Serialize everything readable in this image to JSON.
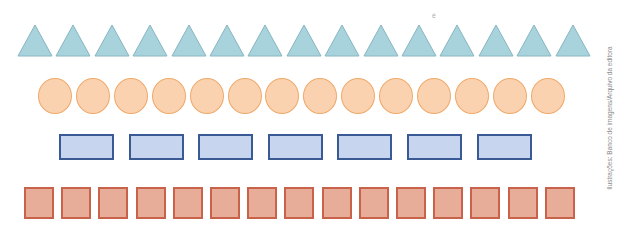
{
  "figure": {
    "rows": [
      {
        "shape": "triangle",
        "count": 15,
        "fill": "#a9d3dc",
        "stroke": "#86b6c1",
        "x0": 17,
        "step": 38.4,
        "top": 24
      },
      {
        "shape": "circle",
        "count": 14,
        "fill": "#fbd2b0",
        "stroke": "#efa96a",
        "x0": 38,
        "step": 37.9,
        "top": 78
      },
      {
        "shape": "rectangle",
        "count": 7,
        "fill": "#c7d5ee",
        "stroke": "#3a5a96",
        "x0": 59,
        "step": 69.6,
        "top": 134
      },
      {
        "shape": "square",
        "count": 15,
        "fill": "#e8ad98",
        "stroke": "#c8624a",
        "x0": 24,
        "step": 37.2,
        "top": 187
      }
    ]
  },
  "credit": "Ilustrações: Banco de imagens/Arquivo da editora",
  "stray_mark": "é"
}
